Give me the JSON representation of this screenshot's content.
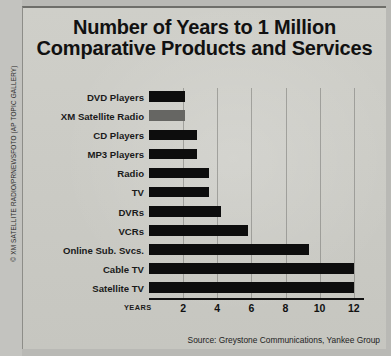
{
  "credit": "© XM SATELLITE RADIO/PRNEWSFOTO (AP TOPIC GALLERY)",
  "source_note": "Source: Greystone Communications, Yankee Group",
  "axis_caption": "YEARS",
  "colors": {
    "bar": "#0d0d0d",
    "highlight_bar": "#666663",
    "panel_background": "#c9c9c3",
    "text": "#111111"
  },
  "chart_data": {
    "type": "bar",
    "orientation": "horizontal",
    "title": "Number of Years to 1 Million Comparative Products and Services",
    "title_line_1": "Number of Years to 1 Million",
    "title_line_2": "Comparative Products and Services",
    "xlabel": "YEARS",
    "ylabel": "",
    "xlim": [
      0,
      12.6
    ],
    "grid": true,
    "legend": "none",
    "xticks": [
      2,
      4,
      6,
      8,
      10,
      12
    ],
    "categories": [
      "DVD Players",
      "XM Satellite Radio",
      "CD Players",
      "MP3 Players",
      "Radio",
      "TV",
      "DVRs",
      "VCRs",
      "Online Sub. Svcs.",
      "Cable TV",
      "Satellite TV"
    ],
    "values": [
      2.1,
      2.1,
      2.8,
      2.8,
      3.5,
      3.5,
      4.2,
      5.8,
      9.4,
      12.0,
      12.0
    ],
    "highlight_category": "XM Satellite Radio"
  }
}
